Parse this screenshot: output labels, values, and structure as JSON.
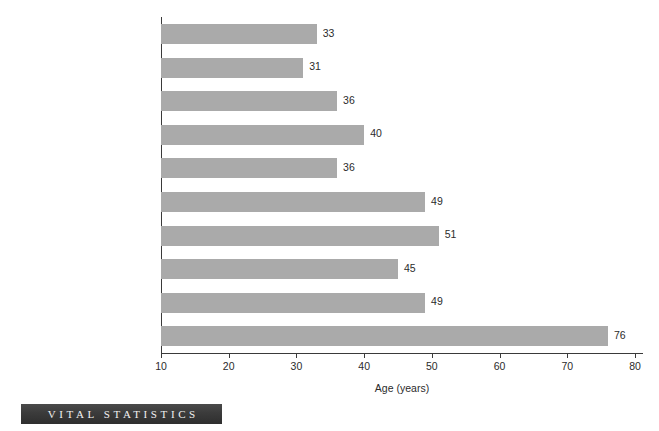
{
  "chart_data": {
    "type": "bar",
    "orientation": "horizontal",
    "title": "",
    "xlabel": "Age (years)",
    "ylabel": "",
    "xlim": [
      10,
      80
    ],
    "xticks": [
      10,
      20,
      30,
      40,
      50,
      60,
      70,
      80
    ],
    "grid": false,
    "legend": false,
    "bar_color": "#aaaaaa",
    "categories": [
      "Neanderthal",
      "Mesolithic",
      "Copper Age (West Turkey)",
      "Bronze Age (Austria)",
      "4th Century A.D. (Ancient Greece and Rome)",
      "Medieval England",
      "17th Century (Breslau, Poland)",
      "18th Century (Philadelphia)",
      "1900 United States",
      "1990 United States"
    ],
    "values": [
      33,
      31,
      36,
      40,
      36,
      49,
      51,
      45,
      49,
      76
    ],
    "bars": [
      {
        "label_lines": [
          "Neanderthal"
        ],
        "label_small_caps": "",
        "value": 33,
        "value_label": "33"
      },
      {
        "label_lines": [
          "Mesolithic"
        ],
        "label_small_caps": "",
        "value": 31,
        "value_label": "31"
      },
      {
        "label_lines": [
          "Copper Age (West Turkey)"
        ],
        "label_small_caps": "",
        "value": 36,
        "value_label": "36"
      },
      {
        "label_lines": [
          "Bronze Age (Austria)"
        ],
        "label_small_caps": "",
        "value": 40,
        "value_label": "40"
      },
      {
        "label_lines": [
          "4th Century ",
          "(Ancient Greece and Rome)"
        ],
        "label_small_caps": "A.D.",
        "value": 36,
        "value_label": "36"
      },
      {
        "label_lines": [
          "Medieval England"
        ],
        "label_small_caps": "",
        "value": 49,
        "value_label": "49"
      },
      {
        "label_lines": [
          "17th Century",
          "(Breslau, Poland)"
        ],
        "label_small_caps": "",
        "value": 51,
        "value_label": "51"
      },
      {
        "label_lines": [
          "18th Century (Philadelphia)"
        ],
        "label_small_caps": "",
        "value": 45,
        "value_label": "45"
      },
      {
        "label_lines": [
          "1900 United States"
        ],
        "label_small_caps": "",
        "value": 49,
        "value_label": "49"
      },
      {
        "label_lines": [
          "1990 United States"
        ],
        "label_small_caps": "",
        "value": 76,
        "value_label": "76"
      }
    ]
  },
  "footer": {
    "banner_text": "VITAL STATISTICS"
  }
}
